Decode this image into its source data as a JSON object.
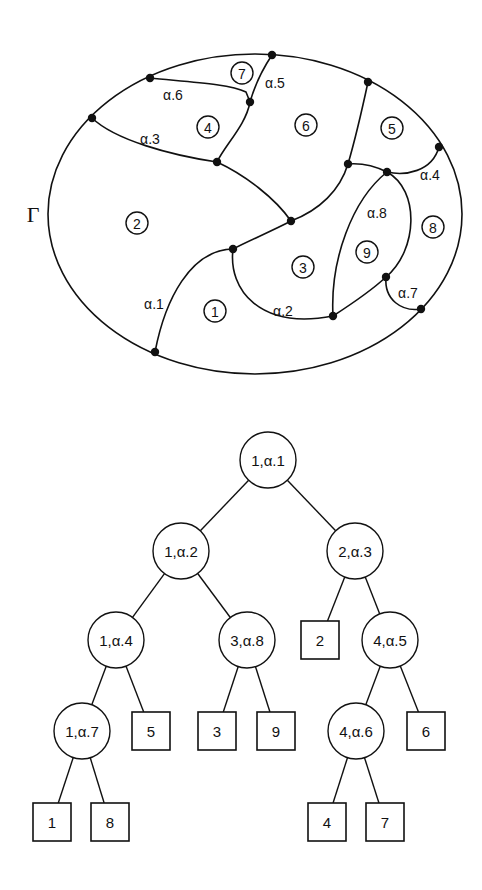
{
  "map": {
    "boundary_label": "Γ",
    "boundary": {
      "cx": 255,
      "cy": 214,
      "rx": 207,
      "ry": 160
    },
    "vertices": {
      "A": [
        272,
        55
      ],
      "B": [
        150,
        78
      ],
      "C": [
        92,
        118
      ],
      "D": [
        250,
        102
      ],
      "E": [
        217,
        162
      ],
      "F": [
        291,
        221
      ],
      "G": [
        233,
        249
      ],
      "H": [
        368,
        82
      ],
      "I": [
        439,
        147
      ],
      "J": [
        348,
        164
      ],
      "K": [
        387,
        172
      ],
      "L": [
        386,
        277
      ],
      "M": [
        333,
        316
      ],
      "N": [
        421,
        309
      ],
      "O": [
        155,
        352
      ]
    },
    "edges": [
      {
        "name": "edge-alpha-6",
        "d": "M150,78 C190,82 230,84 246,92 L250,102"
      },
      {
        "name": "edge-alpha-5",
        "d": "M272,55 C262,70 254,88 250,102"
      },
      {
        "name": "edge-D-E",
        "d": "M250,102 C246,125 225,145 217,162"
      },
      {
        "name": "edge-alpha-3",
        "d": "M92,118 C115,140 170,155 217,162"
      },
      {
        "name": "edge-E-F",
        "d": "M217,162 C245,175 275,198 291,221"
      },
      {
        "name": "edge-F-J",
        "d": "M291,221 C320,210 340,190 348,164"
      },
      {
        "name": "edge-H-J",
        "d": "M368,82 C362,110 355,140 348,164"
      },
      {
        "name": "edge-J-K",
        "d": "M348,164 C360,163 375,166 387,172"
      },
      {
        "name": "edge-alpha-4",
        "d": "M387,172 C405,176 432,172 439,147"
      },
      {
        "name": "edge-F-G",
        "d": "M291,221 C270,232 250,240 233,249"
      },
      {
        "name": "edge-alpha-1",
        "d": "M233,249 C190,250 165,300 155,352"
      },
      {
        "name": "edge-alpha-2",
        "d": "M233,249 C228,290 260,330 333,316"
      },
      {
        "name": "edge-alpha-8",
        "d": "M387,172 C352,200 330,260 333,316"
      },
      {
        "name": "edge-K-L",
        "d": "M387,172 C420,190 418,250 386,277"
      },
      {
        "name": "edge-M-L",
        "d": "M333,316 C350,305 370,292 386,277"
      },
      {
        "name": "edge-alpha-7",
        "d": "M386,277 C384,300 402,312 421,309"
      }
    ],
    "regions": [
      {
        "label": "1",
        "x": 215,
        "y": 311
      },
      {
        "label": "2",
        "x": 137,
        "y": 223
      },
      {
        "label": "3",
        "x": 303,
        "y": 267
      },
      {
        "label": "4",
        "x": 208,
        "y": 127
      },
      {
        "label": "5",
        "x": 392,
        "y": 128
      },
      {
        "label": "6",
        "x": 306,
        "y": 125
      },
      {
        "label": "7",
        "x": 242,
        "y": 73
      },
      {
        "label": "8",
        "x": 433,
        "y": 227
      },
      {
        "label": "9",
        "x": 367,
        "y": 252
      }
    ],
    "edge_labels": [
      {
        "text": "α.1",
        "x": 154,
        "y": 304
      },
      {
        "text": "α.2",
        "x": 283,
        "y": 311
      },
      {
        "text": "α.3",
        "x": 150,
        "y": 139
      },
      {
        "text": "α.4",
        "x": 430,
        "y": 175
      },
      {
        "text": "α.5",
        "x": 275,
        "y": 83
      },
      {
        "text": "α.6",
        "x": 173,
        "y": 95
      },
      {
        "text": "α.7",
        "x": 408,
        "y": 293
      },
      {
        "text": "α.8",
        "x": 377,
        "y": 213
      }
    ]
  },
  "tree": {
    "node_radius": 28,
    "box_size": 38,
    "nodes": [
      {
        "id": "n1",
        "type": "internal",
        "label": "1,α.1",
        "x": 268,
        "y": 460
      },
      {
        "id": "n2",
        "type": "internal",
        "label": "1,α.2",
        "x": 181,
        "y": 551
      },
      {
        "id": "n3",
        "type": "internal",
        "label": "2,α.3",
        "x": 355,
        "y": 551
      },
      {
        "id": "n4",
        "type": "internal",
        "label": "1,α.4",
        "x": 116,
        "y": 640
      },
      {
        "id": "n5",
        "type": "internal",
        "label": "3,α.8",
        "x": 247,
        "y": 640
      },
      {
        "id": "l2",
        "type": "leaf",
        "label": "2",
        "x": 320,
        "y": 640
      },
      {
        "id": "n6",
        "type": "internal",
        "label": "4,α.5",
        "x": 390,
        "y": 640
      },
      {
        "id": "n7",
        "type": "internal",
        "label": "1,α.7",
        "x": 82,
        "y": 731
      },
      {
        "id": "l5",
        "type": "leaf",
        "label": "5",
        "x": 151,
        "y": 731
      },
      {
        "id": "l3",
        "type": "leaf",
        "label": "3",
        "x": 217,
        "y": 731
      },
      {
        "id": "l9",
        "type": "leaf",
        "label": "9",
        "x": 276,
        "y": 731
      },
      {
        "id": "n8",
        "type": "internal",
        "label": "4,α.6",
        "x": 356,
        "y": 731
      },
      {
        "id": "l6",
        "type": "leaf",
        "label": "6",
        "x": 426,
        "y": 731
      },
      {
        "id": "l1",
        "type": "leaf",
        "label": "1",
        "x": 52,
        "y": 822
      },
      {
        "id": "l8",
        "type": "leaf",
        "label": "8",
        "x": 110,
        "y": 822
      },
      {
        "id": "l4",
        "type": "leaf",
        "label": "4",
        "x": 327,
        "y": 822
      },
      {
        "id": "l7",
        "type": "leaf",
        "label": "7",
        "x": 385,
        "y": 822
      }
    ],
    "edges": [
      [
        "n1",
        "n2"
      ],
      [
        "n1",
        "n3"
      ],
      [
        "n2",
        "n4"
      ],
      [
        "n2",
        "n5"
      ],
      [
        "n3",
        "l2"
      ],
      [
        "n3",
        "n6"
      ],
      [
        "n4",
        "n7"
      ],
      [
        "n4",
        "l5"
      ],
      [
        "n5",
        "l3"
      ],
      [
        "n5",
        "l9"
      ],
      [
        "n6",
        "n8"
      ],
      [
        "n6",
        "l6"
      ],
      [
        "n7",
        "l1"
      ],
      [
        "n7",
        "l8"
      ],
      [
        "n8",
        "l4"
      ],
      [
        "n8",
        "l7"
      ]
    ]
  }
}
